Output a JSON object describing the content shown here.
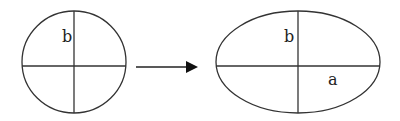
{
  "diagram": {
    "stroke_color": "#333333",
    "circle": {
      "label_b": "b"
    },
    "arrow": {
      "direction": "right"
    },
    "ellipse": {
      "label_b": "b",
      "label_a": "a"
    }
  }
}
